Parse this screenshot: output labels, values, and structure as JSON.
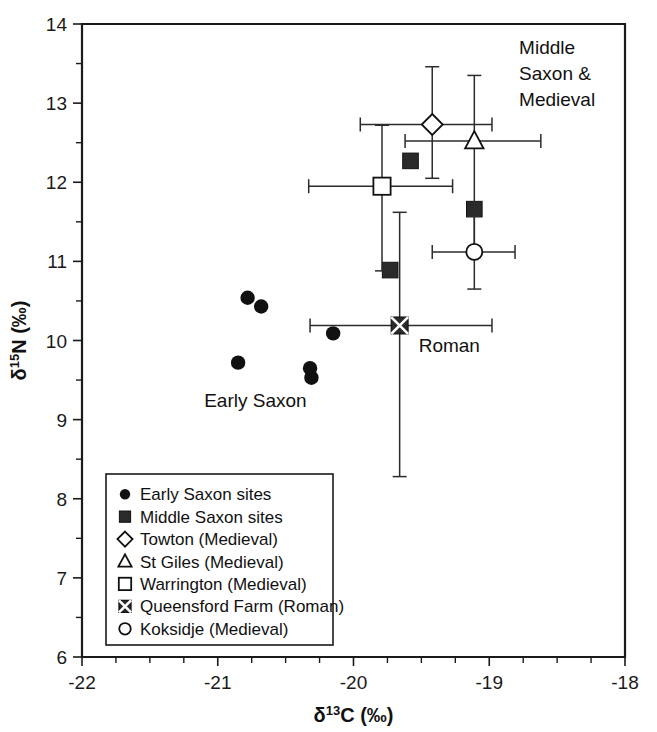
{
  "figure": {
    "title": "",
    "background": "#ffffff",
    "ink_color": "#111111"
  },
  "axes": {
    "x": {
      "label": "δ¹³C (‰)",
      "label_parts": {
        "delta": "δ",
        "sup": "13",
        "element": "C",
        "units": "(‰)"
      },
      "min": -22,
      "max": -18,
      "ticks": [
        -22,
        -21,
        -20,
        -19,
        -18
      ],
      "ticklabels": [
        "-22",
        "-21",
        "-20",
        "-19",
        "-18"
      ],
      "minor_step": 0.25
    },
    "y": {
      "label": "δ¹⁵N (‰)",
      "label_parts": {
        "delta": "δ",
        "sup": "15",
        "element": "N",
        "units": "(‰)"
      },
      "min": 6,
      "max": 14,
      "ticks": [
        6,
        7,
        8,
        9,
        10,
        11,
        12,
        13,
        14
      ],
      "ticklabels": [
        "6",
        "7",
        "8",
        "9",
        "10",
        "11",
        "12",
        "13",
        "14"
      ],
      "minor_step": 0.5
    }
  },
  "annotations": [
    {
      "name": "middle-saxon-medieval",
      "lines": [
        "Middle",
        "Saxon &",
        "Medieval"
      ],
      "x": -18.78,
      "y": 13.62
    },
    {
      "name": "early-saxon",
      "lines": [
        "Early Saxon"
      ],
      "x": -21.1,
      "y": 9.16
    },
    {
      "name": "roman",
      "lines": [
        "Roman"
      ],
      "x": -19.52,
      "y": 9.85
    }
  ],
  "legend": {
    "name": "plot-legend",
    "position": "lower-left",
    "items": [
      {
        "marker": "filled-circle",
        "label": "Early Saxon sites"
      },
      {
        "marker": "filled-square",
        "label": "Middle Saxon sites"
      },
      {
        "marker": "open-diamond",
        "label": "Towton (Medieval)"
      },
      {
        "marker": "open-triangle",
        "label": "St Giles (Medieval)"
      },
      {
        "marker": "open-square",
        "label": "Warrington (Medieval)"
      },
      {
        "marker": "x-square",
        "label": "Queensford Farm (Roman)"
      },
      {
        "marker": "open-circle",
        "label": "Koksidje (Medieval)"
      }
    ]
  },
  "chart_data": {
    "type": "scatter",
    "title": "",
    "xlabel": "δ¹³C (‰)",
    "ylabel": "δ¹⁵N (‰)",
    "xlim": [
      -22,
      -18
    ],
    "ylim": [
      6,
      14
    ],
    "grid": false,
    "legend_position": "lower-left",
    "series": [
      {
        "name": "Early Saxon sites",
        "marker": "filled-circle",
        "points": [
          {
            "x": -20.85,
            "y": 9.72
          },
          {
            "x": -20.78,
            "y": 10.54
          },
          {
            "x": -20.68,
            "y": 10.43
          },
          {
            "x": -20.32,
            "y": 9.65
          },
          {
            "x": -20.31,
            "y": 9.53
          },
          {
            "x": -20.15,
            "y": 10.09
          }
        ]
      },
      {
        "name": "Middle Saxon sites",
        "marker": "filled-square",
        "points": [
          {
            "x": -19.73,
            "y": 10.89
          },
          {
            "x": -19.58,
            "y": 12.27
          },
          {
            "x": -19.11,
            "y": 11.66
          }
        ]
      },
      {
        "name": "Towton (Medieval)",
        "marker": "open-diamond",
        "points": [
          {
            "x": -19.42,
            "y": 12.73,
            "xerr_low": -19.95,
            "xerr_high": -18.98,
            "yerr_low": 12.05,
            "yerr_high": 13.46
          }
        ]
      },
      {
        "name": "St Giles (Medieval)",
        "marker": "open-triangle",
        "points": [
          {
            "x": -19.11,
            "y": 12.52,
            "xerr_low": -19.62,
            "xerr_high": -18.62,
            "yerr_low": 11.12,
            "yerr_high": 13.35
          }
        ]
      },
      {
        "name": "Warrington (Medieval)",
        "marker": "open-square",
        "points": [
          {
            "x": -19.79,
            "y": 11.95,
            "xerr_low": -20.33,
            "xerr_high": -19.27,
            "yerr_low": 10.88,
            "yerr_high": 12.72
          }
        ]
      },
      {
        "name": "Queensford Farm (Roman)",
        "marker": "x-square",
        "points": [
          {
            "x": -19.66,
            "y": 10.19,
            "xerr_low": -20.32,
            "xerr_high": -18.98,
            "yerr_low": 8.28,
            "yerr_high": 11.62
          }
        ]
      },
      {
        "name": "Koksidje (Medieval)",
        "marker": "open-circle",
        "points": [
          {
            "x": -19.11,
            "y": 11.12,
            "xerr_low": -19.42,
            "xerr_high": -18.81,
            "yerr_low": 10.65,
            "yerr_high": 11.57
          }
        ]
      }
    ]
  }
}
